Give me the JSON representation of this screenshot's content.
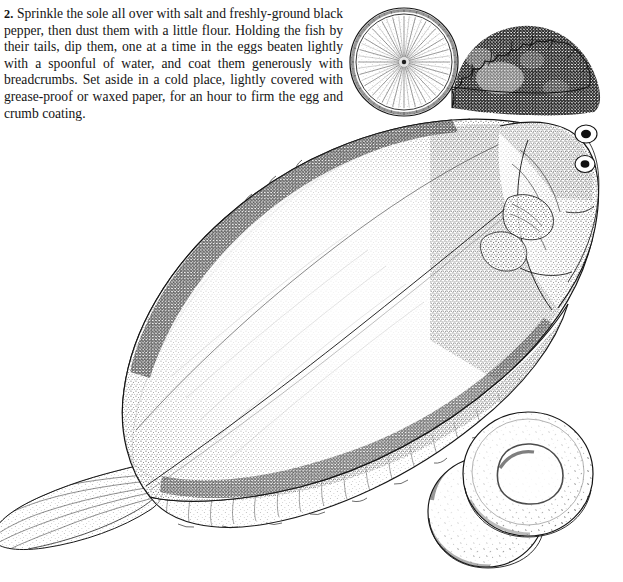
{
  "page": {
    "background_color": "#ffffff",
    "ink_color": "#141414",
    "width": 623,
    "height": 582
  },
  "recipe": {
    "step_number": "2.",
    "body": "Sprinkle the sole all over with salt and freshly-ground black pepper, then dust them with a little flour. Holding the fish by their tails, dip them, one at a time in the eggs beaten lightly with a spoonful of water, and coat them generously with breadcrumbs. Set aside in a cold place, lightly covered with grease-proof or waxed paper, for an hour to firm the egg and crumb coating.",
    "lines": [
      "Sprinkle the sole all over with salt and freshly-",
      "ground black pepper, then dust them with a little",
      "flour. Holding the fish by their tails, dip them, one",
      "at a time in the eggs beaten lightly with a spoonful of",
      "water, and coat them generously with breadcrumbs.",
      "Set aside in a cold place, lightly covered with grease-",
      "proof or waxed paper, for an hour to firm the egg and",
      "crumb coating."
    ]
  },
  "illustration": {
    "title": "Whole sole garnished with lemon slice, parsley and two potato cakes",
    "style": "pen-and-ink stipple engraving",
    "elements": [
      {
        "name": "sole-fish",
        "label": "Whole flatfish (sole) viewed from above, head at right, tail at lower left"
      },
      {
        "name": "lemon-slice",
        "label": "Cut lemon slice with radial segments"
      },
      {
        "name": "parsley-garnish",
        "label": "Dark curly parsley sprig"
      },
      {
        "name": "potato-cake-top",
        "label": "Upper round crumbed potato cake"
      },
      {
        "name": "potato-cake-bottom",
        "label": "Lower round crumbed potato cake"
      }
    ]
  }
}
